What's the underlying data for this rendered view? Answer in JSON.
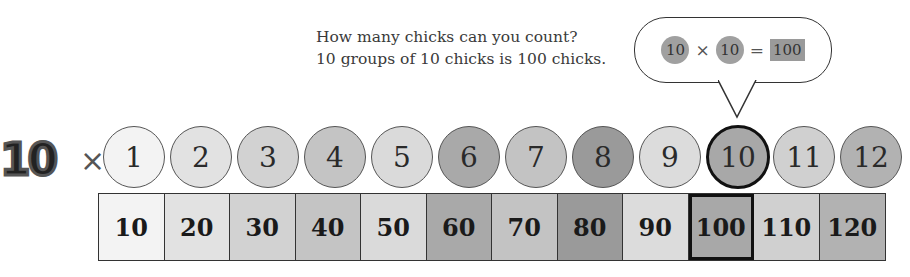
{
  "caption": {
    "line1": "How many chicks can you count?",
    "line2": "10 groups of 10 chicks is 100 chicks."
  },
  "bubble": {
    "left": "10",
    "operator": "×",
    "right": "10",
    "equals": "=",
    "result": "100"
  },
  "header": {
    "multiplier": "10",
    "times": "×"
  },
  "factors": [
    {
      "label": "1",
      "color": "#f3f3f3"
    },
    {
      "label": "2",
      "color": "#e2e2e2"
    },
    {
      "label": "3",
      "color": "#d2d2d2"
    },
    {
      "label": "4",
      "color": "#c4c4c4"
    },
    {
      "label": "5",
      "color": "#dadada"
    },
    {
      "label": "6",
      "color": "#a9a9a9"
    },
    {
      "label": "7",
      "color": "#c3c3c3"
    },
    {
      "label": "8",
      "color": "#9a9a9a"
    },
    {
      "label": "9",
      "color": "#dcdcdc"
    },
    {
      "label": "10",
      "color": "#a8a8a8",
      "highlight": true
    },
    {
      "label": "11",
      "color": "#d0d0d0"
    },
    {
      "label": "12",
      "color": "#b2b2b2"
    }
  ],
  "products": [
    {
      "label": "10",
      "color": "#f3f3f3"
    },
    {
      "label": "20",
      "color": "#e2e2e2"
    },
    {
      "label": "30",
      "color": "#d2d2d2"
    },
    {
      "label": "40",
      "color": "#c4c4c4"
    },
    {
      "label": "50",
      "color": "#dadada"
    },
    {
      "label": "60",
      "color": "#a9a9a9"
    },
    {
      "label": "70",
      "color": "#c3c3c3"
    },
    {
      "label": "80",
      "color": "#9a9a9a"
    },
    {
      "label": "90",
      "color": "#dcdcdc"
    },
    {
      "label": "100",
      "color": "#a8a8a8",
      "highlight": true
    },
    {
      "label": "110",
      "color": "#d0d0d0"
    },
    {
      "label": "120",
      "color": "#b2b2b2"
    }
  ]
}
